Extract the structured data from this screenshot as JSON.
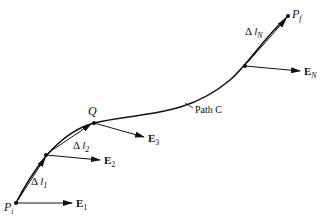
{
  "diagram": {
    "points": {
      "start": {
        "label": "P",
        "sub": "i"
      },
      "q": {
        "label": "Q"
      },
      "end": {
        "label": "P",
        "sub": "f"
      }
    },
    "path_label": "Path C",
    "segments": [
      {
        "delta": "Δ",
        "var": "l",
        "sub": "1"
      },
      {
        "delta": "Δ",
        "var": "l",
        "sub": "2"
      },
      {
        "delta": "Δ",
        "var": "l",
        "sub": "N"
      }
    ],
    "fields": [
      {
        "label": "E",
        "sub": "1"
      },
      {
        "label": "E",
        "sub": "2"
      },
      {
        "label": "E",
        "sub": "3"
      },
      {
        "label": "E",
        "sub": "N"
      }
    ],
    "colors": {
      "ink": "#111111",
      "background": "#ffffff"
    }
  }
}
